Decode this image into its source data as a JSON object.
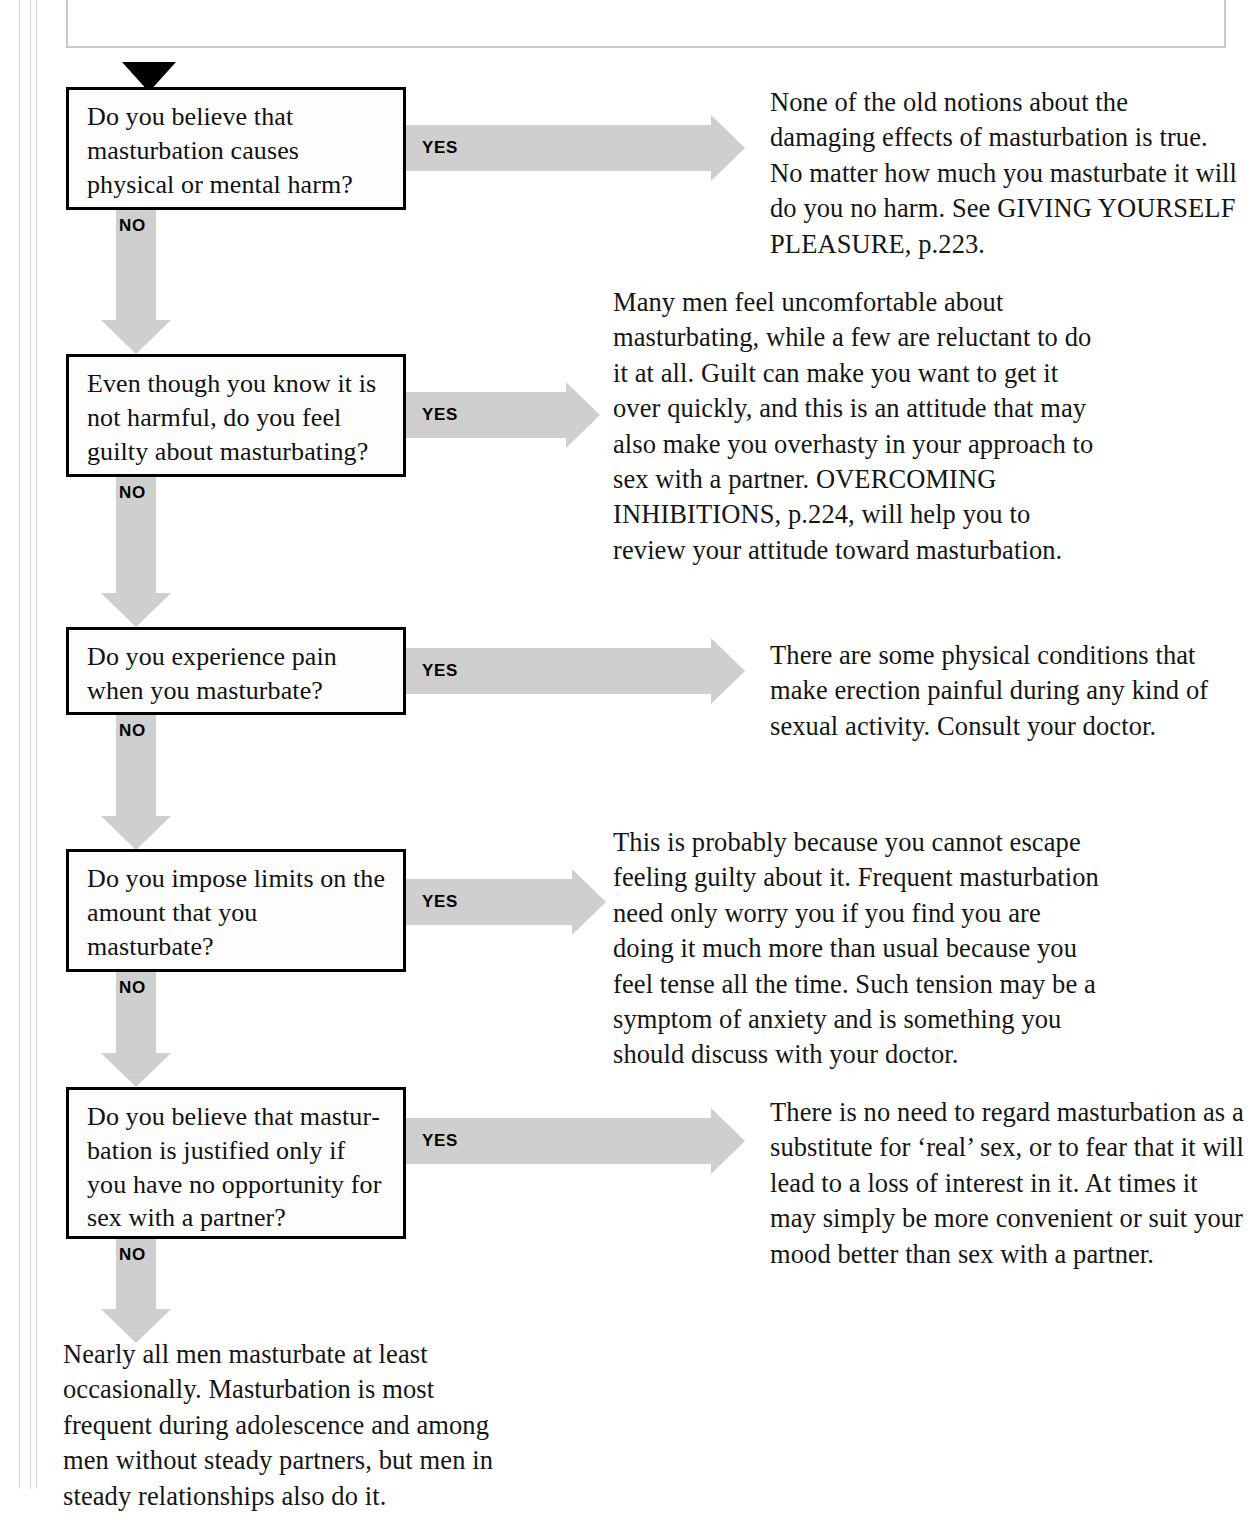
{
  "page": {
    "title": "MASTURBATION ANXIETY",
    "background_color": "#ffffff",
    "arrow_color": "#cfcfcf",
    "box_border_color": "#000000",
    "text_color": "#151515"
  },
  "flow": {
    "start_marker": "solid-down-triangle",
    "yes_label": "YES",
    "no_label": "NO",
    "steps": [
      {
        "question": "Do you believe that masturbation causes physical or mental harm?",
        "yes_label": "YES",
        "no_label": "NO",
        "answer": "None of the old notions about the damaging effects of masturbation is true. No matter how much you masturbate it will do you no harm. See GIVING YOURSELF PLEASURE, p.223."
      },
      {
        "question": "Even though you know it is not harmful, do you feel guilty about masturbating?",
        "yes_label": "YES",
        "no_label": "NO",
        "answer": "Many men feel uncomfortable about masturbating, while a few are reluctant to do it at all. Guilt can make you want to get it over quickly, and this is an attitude that may also make you overhasty in your approach to sex with a partner. OVERCOMING INHIBITIONS, p.224, will help you to review your attitude toward masturbation."
      },
      {
        "question": "Do you experience pain when you masturbate?",
        "yes_label": "YES",
        "no_label": "NO",
        "answer": "There are some physical conditions that make erection painful during any kind of sexual activity. Consult your doctor."
      },
      {
        "question": "Do you impose limits on the amount that you masturbate?",
        "yes_label": "YES",
        "no_label": "NO",
        "answer": "This is probably because you cannot escape feeling guilty about it. Frequent masturbation need only worry you if you find you are doing it much more than usual because you feel tense all the time. Such tension may be a symptom of anxiety and is something you should discuss with your doctor."
      },
      {
        "question": "Do you believe that mastur­bation is justified only if you have no opportunity for sex with a partner?",
        "yes_label": "YES",
        "no_label": "NO",
        "answer": "There is no need to regard masturbation as a substitute for ‘real’ sex, or to fear that it will lead to a loss of interest in it. At times it may simply be more convenient or suit your mood better than sex with a partner."
      }
    ],
    "conclusion": "Nearly all men masturbate at least occasionally. Masturbation is most frequent during adolescence and among men without steady partners, but men in steady relationships also do it."
  }
}
